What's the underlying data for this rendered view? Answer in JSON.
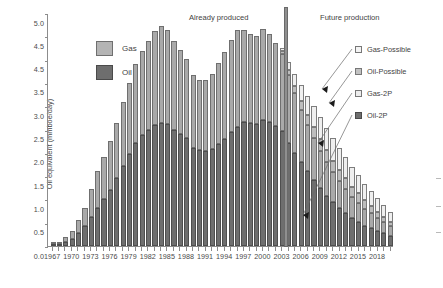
{
  "chart_data": {
    "type": "bar",
    "title": "",
    "xlabel": "",
    "ylabel": "Oil equivalent (mmboe/day)",
    "ylim": [
      0,
      5.0
    ],
    "grid": false,
    "stacked": true,
    "legend_position": "inside-left and right-outside",
    "y_ticks": [
      "0.0",
      "0.5",
      "1.0",
      "1.5",
      "2.0",
      "2.5",
      "3.0",
      "3.5",
      "4.5",
      "4.5",
      "5.0"
    ],
    "y_tick_values": [
      0.0,
      0.5,
      1.0,
      1.5,
      2.0,
      2.5,
      3.0,
      3.5,
      4.0,
      4.5,
      5.0
    ],
    "x_tick_labels": [
      "1967",
      "1970",
      "1973",
      "1976",
      "1979",
      "1982",
      "1985",
      "1988",
      "1991",
      "1994",
      "1997",
      "2000",
      "2003",
      "2006",
      "2009",
      "2012",
      "2015",
      "2018"
    ],
    "x_tick_step": 3,
    "categories": [
      "1967",
      "1968",
      "1969",
      "1970",
      "1971",
      "1972",
      "1973",
      "1974",
      "1975",
      "1976",
      "1977",
      "1978",
      "1979",
      "1980",
      "1981",
      "1982",
      "1983",
      "1984",
      "1985",
      "1986",
      "1987",
      "1988",
      "1989",
      "1990",
      "1991",
      "1992",
      "1993",
      "1994",
      "1995",
      "1996",
      "1997",
      "1998",
      "1999",
      "2000",
      "2001",
      "2002",
      "2003",
      "2004",
      "2005",
      "2006",
      "2007",
      "2008",
      "2009",
      "2010",
      "2011",
      "2012",
      "2013",
      "2014",
      "2015",
      "2016",
      "2017",
      "2018",
      "2019",
      "2020"
    ],
    "series": [
      {
        "name": "Oil-2P",
        "color": "#6e6e6e",
        "values": [
          0.03,
          0.05,
          0.09,
          0.16,
          0.28,
          0.42,
          0.62,
          0.82,
          1.0,
          1.2,
          1.45,
          1.72,
          1.98,
          2.22,
          2.38,
          2.48,
          2.6,
          2.64,
          2.62,
          2.5,
          2.4,
          2.32,
          2.1,
          2.06,
          2.04,
          2.08,
          2.18,
          2.3,
          2.44,
          2.56,
          2.66,
          2.64,
          2.62,
          2.7,
          2.66,
          2.58,
          2.46,
          2.22,
          2.0,
          1.8,
          1.6,
          1.42,
          1.24,
          1.08,
          0.94,
          0.82,
          0.7,
          0.6,
          0.52,
          0.44,
          0.38,
          0.32,
          0.27,
          0.22
        ]
      },
      {
        "name": "Gas-2P",
        "color": "#a9a9a9",
        "values": [
          0.02,
          0.04,
          0.1,
          0.17,
          0.27,
          0.4,
          0.6,
          0.78,
          0.92,
          1.05,
          1.2,
          1.36,
          1.52,
          1.68,
          1.8,
          1.92,
          2.02,
          2.08,
          2.02,
          1.9,
          1.8,
          1.7,
          1.56,
          1.5,
          1.52,
          1.62,
          1.74,
          1.86,
          1.98,
          2.08,
          1.98,
          1.92,
          1.88,
          1.95,
          1.88,
          1.78,
          1.66,
          1.44,
          1.28,
          1.12,
          1.0,
          0.9,
          0.8,
          0.72,
          0.64,
          0.58,
          0.52,
          0.46,
          0.41,
          0.36,
          0.32,
          0.28,
          0.24,
          0.2
        ]
      },
      {
        "name": "Oil-Possible",
        "color": "#bdbdbd",
        "values": [
          0,
          0,
          0,
          0,
          0,
          0,
          0,
          0,
          0,
          0,
          0,
          0,
          0,
          0,
          0,
          0,
          0,
          0,
          0,
          0,
          0,
          0,
          0,
          0,
          0,
          0,
          0,
          0,
          0,
          0,
          0,
          0,
          0,
          0,
          0,
          0,
          0.06,
          0.12,
          0.16,
          0.2,
          0.22,
          0.24,
          0.25,
          0.25,
          0.25,
          0.24,
          0.23,
          0.21,
          0.2,
          0.18,
          0.16,
          0.14,
          0.12,
          0.1
        ]
      },
      {
        "name": "Gas-Possible",
        "color": "#efefef",
        "values": [
          0,
          0,
          0,
          0,
          0,
          0,
          0,
          0,
          0,
          0,
          0,
          0,
          0,
          0,
          0,
          0,
          0,
          0,
          0,
          0,
          0,
          0,
          0,
          0,
          0,
          0,
          0,
          0,
          0,
          0,
          0,
          0,
          0,
          0,
          0,
          0,
          0.08,
          0.18,
          0.26,
          0.34,
          0.4,
          0.44,
          0.47,
          0.48,
          0.48,
          0.47,
          0.45,
          0.42,
          0.39,
          0.36,
          0.32,
          0.29,
          0.25,
          0.22
        ]
      }
    ],
    "annotations": [
      {
        "name": "already-produced",
        "text": "Already produced",
        "x_year": 1997
      },
      {
        "name": "future-production",
        "text": "Future production",
        "x_year": 2008
      },
      {
        "name": "divider",
        "text": "",
        "x_year": 2003.6
      }
    ]
  },
  "legend_left": {
    "items": [
      {
        "label": "Gas",
        "swatch": "sw-gas"
      },
      {
        "label": "Oil",
        "swatch": "sw-oil"
      }
    ]
  },
  "legend_right": {
    "items": [
      {
        "label": "Gas-Possible",
        "swatch": "sw-gaspos"
      },
      {
        "label": "Oil-Possible",
        "swatch": "sw-oilpos"
      },
      {
        "label": "Gas-2P",
        "swatch": "sw-gas2p"
      },
      {
        "label": "Oil-2P",
        "swatch": "sw-oil2p"
      }
    ]
  }
}
